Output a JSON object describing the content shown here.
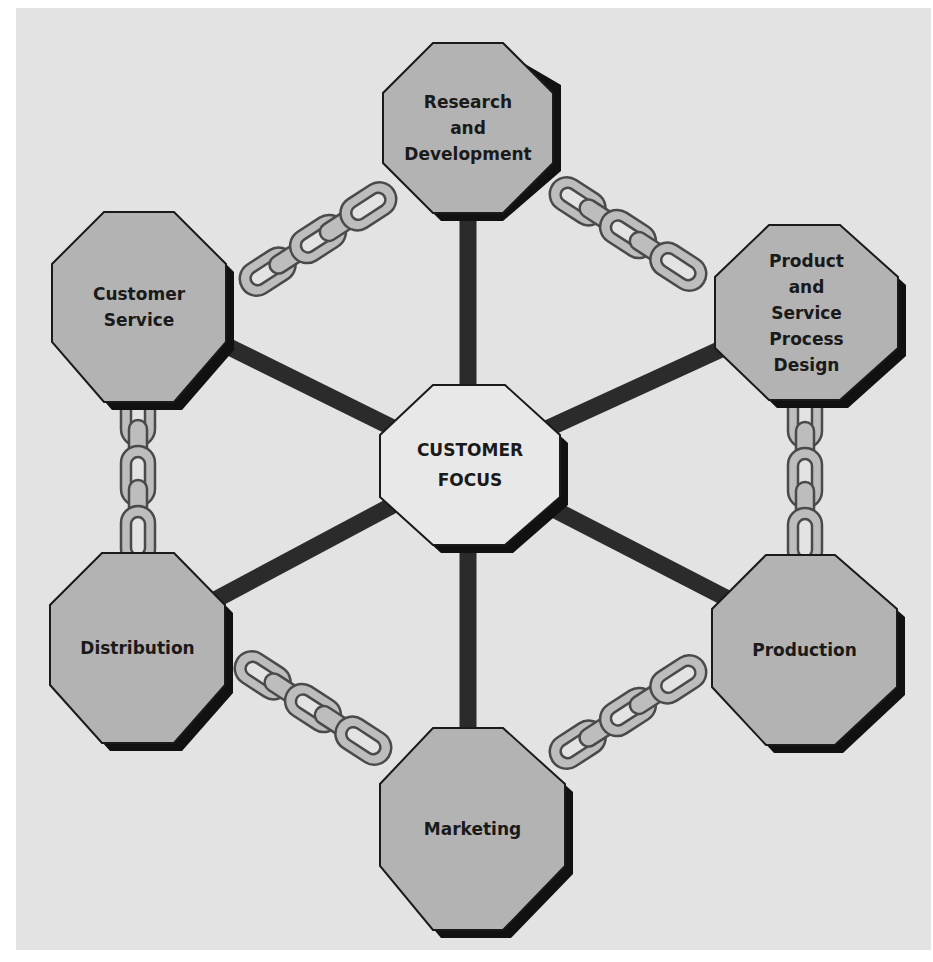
{
  "diagram": {
    "title": "",
    "center": {
      "id": "customer-focus",
      "label": "CUSTOMER\nFOCUS"
    },
    "nodes": [
      {
        "id": "research-development",
        "label": "Research\nand\nDevelopment"
      },
      {
        "id": "product-service-process-design",
        "label": "Product\nand\nService\nProcess\nDesign"
      },
      {
        "id": "production",
        "label": "Production"
      },
      {
        "id": "marketing",
        "label": "Marketing"
      },
      {
        "id": "distribution",
        "label": "Distribution"
      },
      {
        "id": "customer-service",
        "label": "Customer\nService"
      }
    ],
    "spokes": [
      {
        "from": "customer-focus",
        "to": "research-development"
      },
      {
        "from": "customer-focus",
        "to": "product-service-process-design"
      },
      {
        "from": "customer-focus",
        "to": "production"
      },
      {
        "from": "customer-focus",
        "to": "marketing"
      },
      {
        "from": "customer-focus",
        "to": "distribution"
      },
      {
        "from": "customer-focus",
        "to": "customer-service"
      }
    ],
    "chains": [
      {
        "from": "customer-service",
        "to": "research-development"
      },
      {
        "from": "research-development",
        "to": "product-service-process-design"
      },
      {
        "from": "product-service-process-design",
        "to": "production"
      },
      {
        "from": "production",
        "to": "marketing"
      },
      {
        "from": "marketing",
        "to": "distribution"
      },
      {
        "from": "distribution",
        "to": "customer-service"
      }
    ],
    "colors": {
      "background": "#e3e3e3",
      "node_fill": "#b3b3b3",
      "center_fill": "#e8e8e8",
      "outline": "#1a1a1a",
      "shadow": "#111111",
      "spoke": "#2b2b2b",
      "chain_fill": "#bdbdbd",
      "chain_outline": "#4a4a4a"
    }
  }
}
